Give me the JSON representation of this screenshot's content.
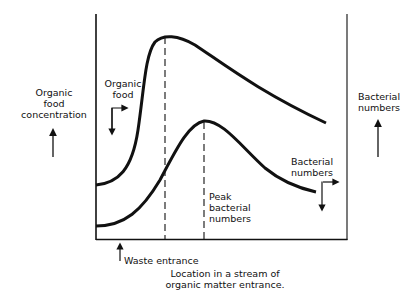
{
  "diagram": {
    "y_axis_left_label": [
      "Organic",
      "food",
      "concentration"
    ],
    "y_axis_right_label": [
      "Bacterial",
      "numbers"
    ],
    "x_axis_label": [
      "Location in a stream of",
      "organic matter entrance."
    ],
    "annotations": {
      "organic_food": [
        "Organic",
        "food"
      ],
      "bacterial_numbers": [
        "Bacterial",
        "numbers"
      ],
      "peak_bacterial": [
        "Peak",
        "bacterial",
        "numbers"
      ],
      "waste_entrance": "Waste entrance"
    },
    "curves": [
      {
        "name": "Organic food",
        "shape": "rises sharply after waste entrance, peaks early, then declines gradually"
      },
      {
        "name": "Bacterial numbers",
        "shape": "rises gradually, peaks later (Peak bacterial numbers), then declines"
      }
    ],
    "dashed_markers": [
      "Organic food peak",
      "Peak bacterial numbers"
    ],
    "colors": {
      "ink": "#111111",
      "background": "#ffffff"
    }
  }
}
